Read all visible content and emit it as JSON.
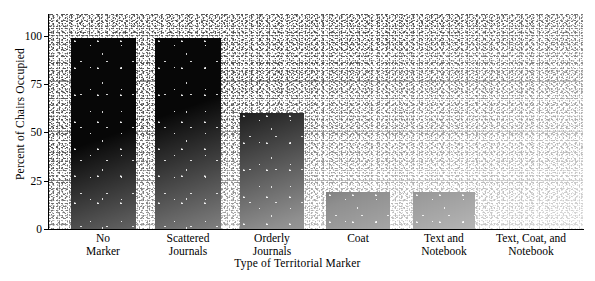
{
  "chart_data": {
    "type": "bar",
    "title": "",
    "xlabel": "Type of Territorial Marker",
    "ylabel": "Percent of Chairs Occupied",
    "categories": [
      "No\nMarker",
      "Scattered\nJournals",
      "Orderly\nJournals",
      "Coat",
      "Text and\nNotebook",
      "Text, Coat, and\nNotebook"
    ],
    "values": [
      99,
      99,
      60,
      19,
      19,
      0
    ],
    "ylim": [
      0,
      100
    ],
    "yticks": [
      0,
      25,
      50,
      75,
      100
    ],
    "ytick_labels": [
      "0",
      "25",
      "50",
      "75",
      "100"
    ],
    "grid": "horizontal",
    "legend": "none",
    "bar_color": "#070707",
    "plot_background": "#b8b8b8",
    "axis_color": "#000000"
  },
  "geometry": {
    "bars": [
      {
        "left": 22,
        "width": 65
      },
      {
        "left": 106,
        "width": 66
      },
      {
        "left": 191,
        "width": 64
      },
      {
        "left": 277,
        "width": 64
      },
      {
        "left": 364,
        "width": 62
      },
      {
        "left": 450,
        "width": 0
      }
    ],
    "xtick_centers": [
      103,
      188,
      272,
      358,
      444,
      531
    ],
    "xtick_widths": [
      90,
      95,
      90,
      80,
      95,
      120
    ],
    "ytick_tops": [
      36,
      84,
      132,
      181,
      229
    ]
  }
}
